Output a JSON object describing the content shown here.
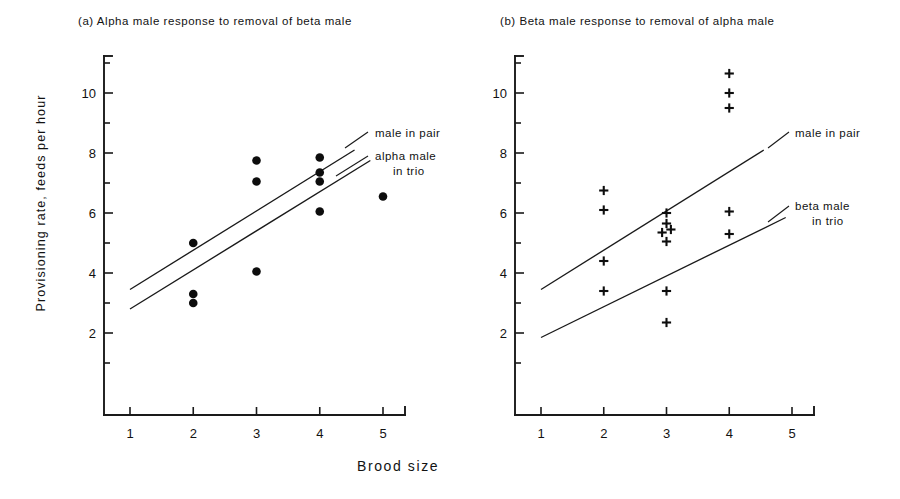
{
  "figure": {
    "xlabel": "Brood size",
    "ylabel": "Provisioning rate, feeds per hour"
  },
  "panels": {
    "a": {
      "title": "(a) Alpha male response to removal of beta male",
      "annotation_upper": "male in pair",
      "annotation_lower_line1": "alpha male",
      "annotation_lower_line2": "in trio"
    },
    "b": {
      "title": "(b) Beta male response to removal of alpha male",
      "annotation_upper": "male in pair",
      "annotation_lower_line1": "beta male",
      "annotation_lower_line2": "in trio"
    }
  },
  "chart_data": [
    {
      "id": "panel-a",
      "type": "scatter",
      "title": "(a) Alpha male response to removal of beta male",
      "xlabel": "Brood size",
      "ylabel": "Provisioning rate, feeds per hour",
      "xlim": [
        0.6,
        5.4
      ],
      "ylim": [
        0.4,
        11.2
      ],
      "xticks": [
        1,
        2,
        3,
        4,
        5
      ],
      "yticks": [
        2,
        4,
        6,
        8,
        10
      ],
      "yminorticks": [
        1,
        3,
        5,
        7,
        9,
        11
      ],
      "grid": false,
      "marker": "filled-circle",
      "points": [
        {
          "x": 2,
          "y": 5.0
        },
        {
          "x": 2,
          "y": 3.3
        },
        {
          "x": 2,
          "y": 3.0
        },
        {
          "x": 3,
          "y": 7.75
        },
        {
          "x": 3,
          "y": 7.05
        },
        {
          "x": 3,
          "y": 4.05
        },
        {
          "x": 4,
          "y": 7.85
        },
        {
          "x": 4,
          "y": 7.35
        },
        {
          "x": 4,
          "y": 7.05
        },
        {
          "x": 4,
          "y": 6.05
        },
        {
          "x": 5,
          "y": 6.55
        }
      ],
      "series": [
        {
          "name": "male in pair",
          "type": "line",
          "x": [
            1,
            4.55
          ],
          "y": [
            3.45,
            8.1
          ]
        },
        {
          "name": "alpha male in trio",
          "type": "line",
          "x": [
            1,
            4.8
          ],
          "y": [
            2.8,
            7.75
          ]
        }
      ]
    },
    {
      "id": "panel-b",
      "type": "scatter",
      "title": "(b) Beta male response to removal of alpha male",
      "xlabel": "Brood size",
      "ylabel": "Provisioning rate, feeds per hour",
      "xlim": [
        0.6,
        5.4
      ],
      "ylim": [
        0.4,
        11.2
      ],
      "xticks": [
        1,
        2,
        3,
        4,
        5
      ],
      "yticks": [
        2,
        4,
        6,
        8,
        10
      ],
      "yminorticks": [
        1,
        3,
        5,
        7,
        9,
        11
      ],
      "grid": false,
      "marker": "plus",
      "points": [
        {
          "x": 2,
          "y": 6.75
        },
        {
          "x": 2,
          "y": 6.1
        },
        {
          "x": 2,
          "y": 4.4
        },
        {
          "x": 2,
          "y": 3.4
        },
        {
          "x": 3,
          "y": 6.0
        },
        {
          "x": 3,
          "y": 5.65
        },
        {
          "x": 3.07,
          "y": 5.45
        },
        {
          "x": 2.93,
          "y": 5.35
        },
        {
          "x": 3,
          "y": 5.05
        },
        {
          "x": 3,
          "y": 3.4
        },
        {
          "x": 3,
          "y": 2.35
        },
        {
          "x": 4,
          "y": 10.65
        },
        {
          "x": 4,
          "y": 10.0
        },
        {
          "x": 4,
          "y": 9.5
        },
        {
          "x": 4,
          "y": 6.05
        },
        {
          "x": 4,
          "y": 5.3
        }
      ],
      "series": [
        {
          "name": "male in pair",
          "type": "line",
          "x": [
            1,
            4.55
          ],
          "y": [
            3.45,
            8.1
          ]
        },
        {
          "name": "beta male in trio",
          "type": "line",
          "x": [
            1,
            4.9
          ],
          "y": [
            1.85,
            5.85
          ]
        }
      ]
    }
  ]
}
